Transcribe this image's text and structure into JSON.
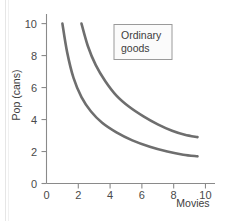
{
  "chart_data": {
    "type": "line",
    "title": "",
    "xlabel": "Movies",
    "ylabel": "Pop (cans)",
    "xlim": [
      0,
      10.6
    ],
    "ylim": [
      0,
      10.6
    ],
    "xticks": [
      "0",
      "2",
      "4",
      "6",
      "8",
      "10"
    ],
    "xtick_values": [
      0,
      2,
      4,
      6,
      8,
      10
    ],
    "yticks": [
      "0",
      "2",
      "4",
      "6",
      "8",
      "10"
    ],
    "ytick_values": [
      0,
      2,
      4,
      6,
      8,
      10
    ],
    "grid": false,
    "annotations": [
      {
        "name": "ordinary-goods-box",
        "line1": "Ordinary",
        "line2": "goods",
        "x": 5.2,
        "y": 9.0
      }
    ],
    "series": [
      {
        "name": "indifference-curve-lower",
        "color": "#6e6e6e",
        "points": [
          [
            1.0,
            10.0
          ],
          [
            1.3,
            8.2
          ],
          [
            1.7,
            6.6
          ],
          [
            2.2,
            5.4
          ],
          [
            2.8,
            4.5
          ],
          [
            3.5,
            3.8
          ],
          [
            4.4,
            3.2
          ],
          [
            5.4,
            2.7
          ],
          [
            6.5,
            2.3
          ],
          [
            7.6,
            2.0
          ],
          [
            8.6,
            1.8
          ],
          [
            9.5,
            1.7
          ]
        ]
      },
      {
        "name": "indifference-curve-upper",
        "color": "#6e6e6e",
        "points": [
          [
            2.2,
            10.0
          ],
          [
            2.6,
            8.6
          ],
          [
            3.1,
            7.4
          ],
          [
            3.7,
            6.4
          ],
          [
            4.4,
            5.5
          ],
          [
            5.2,
            4.8
          ],
          [
            6.1,
            4.2
          ],
          [
            7.0,
            3.7
          ],
          [
            7.9,
            3.3
          ],
          [
            8.7,
            3.05
          ],
          [
            9.5,
            2.9
          ]
        ]
      }
    ]
  },
  "axes": {
    "ylabel": "Pop (cans)",
    "xlabel": "Movies"
  },
  "legend": {
    "line1": "Ordinary",
    "line2": "goods"
  },
  "colors": {
    "curve": "#6e6e6e",
    "axis": "#8a8a8a",
    "text": "#3d3d3d",
    "legend_border": "#9a9a9a",
    "legend_fill": "#fbfbfb",
    "background": "#ffffff"
  }
}
